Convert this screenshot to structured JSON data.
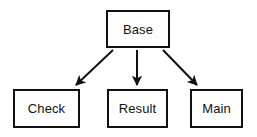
{
  "diagram": {
    "type": "inheritance-hierarchy",
    "background_color": "#ffffff",
    "line_color": "#111111",
    "text_color": "#111111",
    "nodes": [
      {
        "id": "base",
        "label": "Base",
        "shape": "rectangle"
      },
      {
        "id": "check",
        "label": "Check",
        "shape": "rectangle"
      },
      {
        "id": "result",
        "label": "Result",
        "shape": "rectangle"
      },
      {
        "id": "main",
        "label": "Main",
        "shape": "rectangle"
      }
    ],
    "edges": [
      {
        "id": "base-to-check",
        "from": "Base",
        "to": "Check",
        "style": "solid",
        "arrowhead": "filled-triangle"
      },
      {
        "id": "base-to-result",
        "from": "Base",
        "to": "Result",
        "style": "solid",
        "arrowhead": "filled-triangle"
      },
      {
        "id": "base-to-main",
        "from": "Base",
        "to": "Main",
        "style": "solid",
        "arrowhead": "filled-triangle"
      }
    ]
  }
}
